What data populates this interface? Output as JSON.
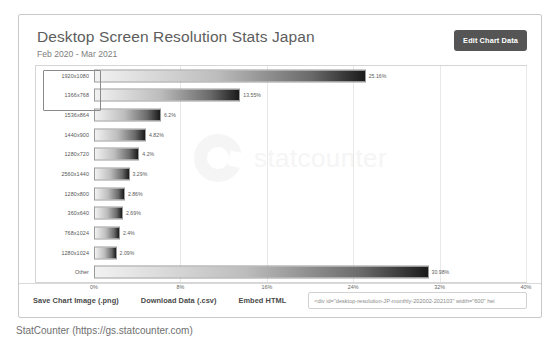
{
  "header": {
    "title": "Desktop Screen Resolution Stats Japan",
    "subtitle": "Feb 2020 - Mar 2021",
    "edit_button_label": "Edit Chart Data"
  },
  "watermark": {
    "text": "statcounter",
    "logo_name": "statcounter-ring-logo"
  },
  "footer": {
    "save_image_label": "Save Chart Image (.png)",
    "download_data_label": "Download Data (.csv)",
    "embed_html_label": "Embed HTML",
    "embed_value": "<div id=\"desktop-resolution-JP-monthly-202002-202103\" width=\"600\" hei"
  },
  "caption": "StatCounter (https://gs.statcounter.com)",
  "colors": {
    "card_border": "#c9c9c9",
    "title_text": "#5d5d5d",
    "subtitle_text": "#7d7d7d",
    "button_bg": "#555555",
    "button_text": "#ffffff",
    "bar_border": "#9a9a9a",
    "bar_gradient_start": "#f2f2f2",
    "bar_gradient_end": "#1a1a1a",
    "gridline": "#e8e8e8",
    "watermark": "#ededed",
    "selection_border": "#8a8a8a"
  },
  "chart_data": {
    "type": "bar",
    "orientation": "horizontal",
    "title": "Desktop Screen Resolution Stats Japan",
    "subtitle": "Feb 2020 - Mar 2021",
    "xlabel": "",
    "ylabel": "",
    "xlim": [
      0,
      40
    ],
    "grid": true,
    "legend": false,
    "xticks": [
      "0%",
      "8%",
      "16%",
      "24%",
      "32%",
      "40%"
    ],
    "xtick_values": [
      0,
      8,
      16,
      24,
      32,
      40
    ],
    "categories": [
      "1920x1080",
      "1366x768",
      "1536x864",
      "1440x900",
      "1280x720",
      "2560x1440",
      "1280x800",
      "360x640",
      "768x1024",
      "1280x1024",
      "Other"
    ],
    "values": [
      25.16,
      13.55,
      6.2,
      4.82,
      4.2,
      3.29,
      2.86,
      2.69,
      2.4,
      2.09,
      30.98
    ],
    "value_labels": [
      "25.16%",
      "13.55%",
      "6.2%",
      "4.82%",
      "4.2%",
      "3.29%",
      "2.86%",
      "2.69%",
      "2.4%",
      "2.09%",
      "30.98%"
    ],
    "selected_categories": [
      "1920x1080",
      "1366x768"
    ]
  }
}
